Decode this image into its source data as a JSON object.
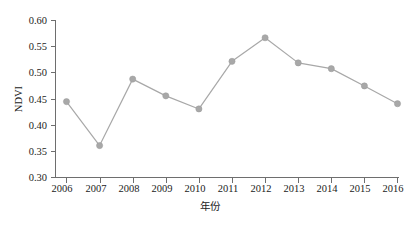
{
  "chart_data": {
    "type": "line",
    "title": "",
    "xlabel": "年份",
    "ylabel": "NDVI",
    "x": [
      2006,
      2007,
      2008,
      2009,
      2010,
      2011,
      2012,
      2013,
      2014,
      2015,
      2016
    ],
    "categories": [
      "2006",
      "2007",
      "2008",
      "2009",
      "2010",
      "2011",
      "2012",
      "2013",
      "2014",
      "2015",
      "2016"
    ],
    "values": [
      0.445,
      0.361,
      0.488,
      0.456,
      0.431,
      0.522,
      0.567,
      0.519,
      0.508,
      0.475,
      0.441
    ],
    "series": [
      {
        "name": "NDVI",
        "values": [
          0.445,
          0.361,
          0.488,
          0.456,
          0.431,
          0.522,
          0.567,
          0.519,
          0.508,
          0.475,
          0.441
        ]
      }
    ],
    "xlim": [
      2005.6,
      2016.6
    ],
    "ylim": [
      0.3,
      0.6
    ],
    "ytick_labels": [
      "0.30",
      "0.35",
      "0.40",
      "0.45",
      "0.50",
      "0.55",
      "0.60"
    ],
    "ytick_values": [
      0.3,
      0.35,
      0.4,
      0.45,
      0.5,
      0.55,
      0.6
    ],
    "xtick_labels": [
      "2006",
      "2007",
      "2008",
      "2009",
      "2010",
      "2011",
      "2012",
      "2013",
      "2014",
      "2015",
      "2016"
    ],
    "grid": false,
    "legend": false,
    "legend_position": "none",
    "line_color": "#a8a8a8",
    "marker_color": "#a8a8a8",
    "marker": "circle",
    "axis_color": "#6e6e6e",
    "text_color": "#1b1b1b",
    "background": "#ffffff"
  }
}
